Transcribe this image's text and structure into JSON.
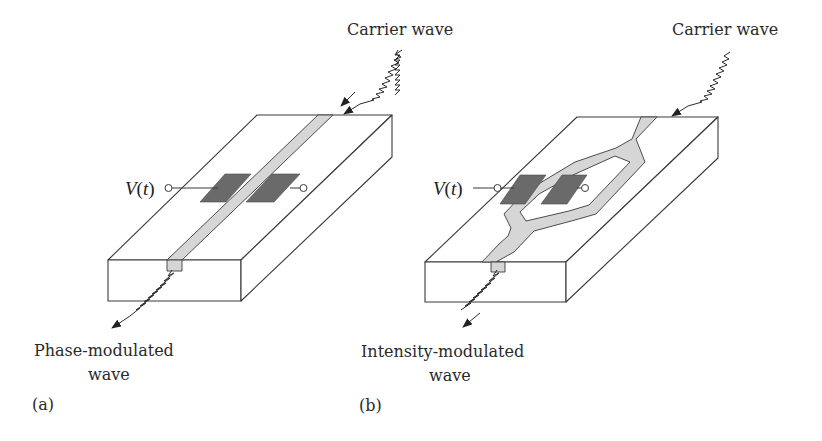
{
  "panels": [
    {
      "id": "a",
      "tag": "(a)",
      "input_label": "Carrier wave",
      "output_label_line1": "Phase-modulated",
      "output_label_line2": "wave",
      "voltage_label": "V",
      "voltage_arg": "t",
      "waveguide": "straight"
    },
    {
      "id": "b",
      "tag": "(b)",
      "input_label": "Carrier wave",
      "output_label_line1": "Intensity-modulated",
      "output_label_line2": "wave",
      "voltage_label": "V",
      "voltage_arg": "t",
      "waveguide": "mach-zehnder"
    }
  ],
  "colors": {
    "outline": "#3a3a3a",
    "waveguide": "#d6d6d6",
    "electrode": "#6a6a6a",
    "background": "#ffffff"
  }
}
